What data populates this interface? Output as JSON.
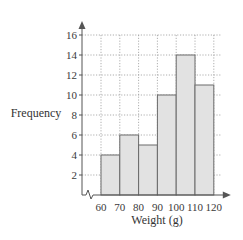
{
  "chart_data": {
    "type": "bar",
    "subtype": "histogram",
    "title": "",
    "xlabel": "Weight (g)",
    "ylabel": "Frequency",
    "bins": [
      [
        60,
        70
      ],
      [
        70,
        80
      ],
      [
        80,
        90
      ],
      [
        90,
        100
      ],
      [
        100,
        110
      ],
      [
        110,
        120
      ]
    ],
    "categories": [
      "60-70",
      "70-80",
      "80-90",
      "90-100",
      "100-110",
      "110-120"
    ],
    "values": [
      4,
      6,
      5,
      10,
      14,
      11
    ],
    "x_ticks": [
      60,
      70,
      80,
      90,
      100,
      110,
      120
    ],
    "y_ticks": [
      2,
      4,
      6,
      8,
      10,
      12,
      14,
      16
    ],
    "xlim": [
      60,
      120
    ],
    "ylim": [
      0,
      16
    ],
    "grid": true,
    "grid_style": "dotted",
    "x_axis_break": true,
    "bar_color": "#e2e2e2",
    "edge_color": "#6a6a6a"
  }
}
